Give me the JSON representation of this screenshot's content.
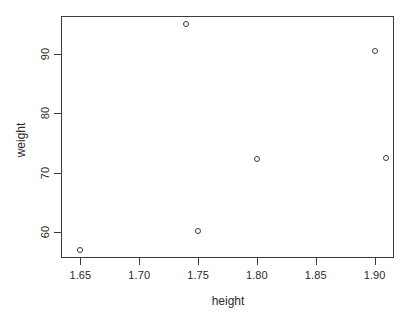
{
  "chart_data": {
    "type": "scatter",
    "title": "",
    "xlabel": "height",
    "ylabel": "weight",
    "xlim": [
      1.6335,
      1.9165
    ],
    "ylim": [
      55.7,
      96.3
    ],
    "grid": false,
    "legend": "none",
    "marker": "open-circle",
    "xticks": [
      1.65,
      1.7,
      1.75,
      1.8,
      1.85,
      1.9
    ],
    "xtick_labels": [
      "1.65",
      "1.70",
      "1.75",
      "1.80",
      "1.85",
      "1.90"
    ],
    "yticks": [
      60,
      70,
      80,
      90
    ],
    "ytick_labels": [
      "60",
      "70",
      "80",
      "90"
    ],
    "points": [
      {
        "x": 1.65,
        "y": 57.0
      },
      {
        "x": 1.74,
        "y": 95.0
      },
      {
        "x": 1.75,
        "y": 60.3
      },
      {
        "x": 1.8,
        "y": 72.3
      },
      {
        "x": 1.9,
        "y": 90.5
      },
      {
        "x": 1.91,
        "y": 72.4
      }
    ],
    "colors": {
      "axis": "#3c3c3c",
      "marker": "#3a3a3a",
      "text": "#2b2b2b",
      "background": "#ffffff"
    }
  }
}
